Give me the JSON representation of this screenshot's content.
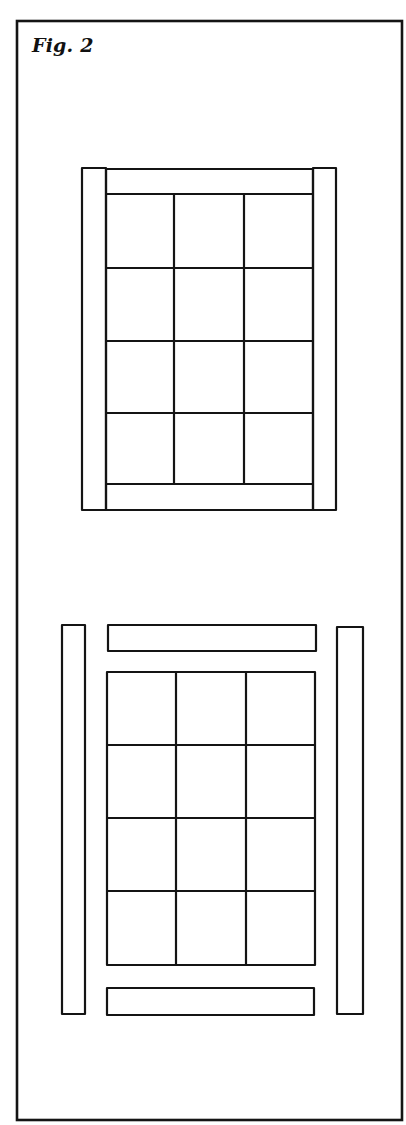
{
  "figure": {
    "label": "Fig. 2",
    "frame": {
      "x": 17,
      "y": 21,
      "w": 385,
      "h": 1099
    },
    "stroke_color": "#141414",
    "background": "#ffffff"
  },
  "assembled_quilt": {
    "description": "Assembled: 3x4 block grid with top/bottom border strips and full-length side strips",
    "side_strips": [
      {
        "x": 82,
        "y": 168,
        "w": 24,
        "h": 342
      },
      {
        "x": 313,
        "y": 168,
        "w": 23,
        "h": 342
      }
    ],
    "top_strip": {
      "x": 106,
      "y": 169,
      "w": 207,
      "h": 25
    },
    "bottom_strip": {
      "x": 106,
      "y": 484,
      "w": 207,
      "h": 26
    },
    "grid": {
      "x": 106,
      "y": 194,
      "w": 207,
      "h": 290,
      "cols": 3,
      "rows": 4,
      "col_lines": [
        174,
        244
      ],
      "row_lines": [
        268,
        341,
        413
      ]
    }
  },
  "exploded_quilt": {
    "description": "Exploded: grid separated from top/bottom strips and side strips",
    "side_strips": [
      {
        "x": 62,
        "y": 625,
        "w": 23,
        "h": 389
      },
      {
        "x": 337,
        "y": 627,
        "w": 26,
        "h": 387
      }
    ],
    "top_strip": {
      "x": 108,
      "y": 625,
      "w": 208,
      "h": 26
    },
    "bottom_strip": {
      "x": 107,
      "y": 988,
      "w": 207,
      "h": 27
    },
    "grid": {
      "x": 107,
      "y": 672,
      "w": 208,
      "h": 293,
      "cols": 3,
      "rows": 4,
      "col_lines": [
        176,
        246
      ],
      "row_lines": [
        745,
        818,
        891
      ]
    }
  }
}
